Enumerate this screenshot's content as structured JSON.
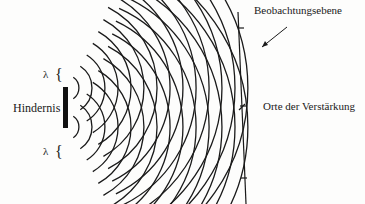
{
  "diagram": {
    "labels": {
      "observation_plane": "Beobachtungsebene",
      "reinforcement": "Orte der Verstärkung",
      "obstacle": "Hindernis",
      "lambda_top": "λ",
      "lambda_bottom": "λ",
      "brace_top": "{",
      "brace_bottom": "{"
    },
    "sources": [
      {
        "name": "upper-edge-source",
        "x": 66,
        "y": 88
      },
      {
        "name": "lower-edge-source",
        "x": 66,
        "y": 127
      }
    ],
    "wavelength_px": 13,
    "num_wavefronts": 14,
    "observation_plane_x": 240,
    "colors": {
      "ink": "#1a1a1a",
      "background": "#fdfdfc"
    }
  }
}
